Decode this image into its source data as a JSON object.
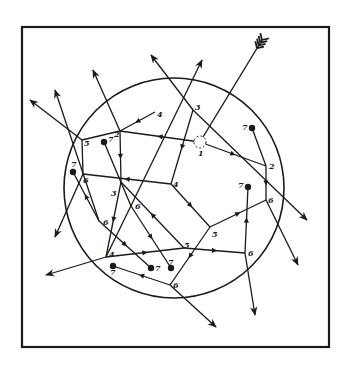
{
  "diagram": {
    "type": "hand-drawn network diagram",
    "colors": {
      "ink": "#1a1a1a",
      "background": "#ffffff"
    },
    "frame": {
      "x": 22,
      "y": 27,
      "width": 307,
      "height": 320
    },
    "circle": {
      "cx": 174,
      "cy": 188,
      "r": 110
    },
    "entry_arrow": {
      "from": [
        262,
        40
      ],
      "to": [
        200,
        142
      ],
      "fletching": true
    },
    "start_marker": {
      "x": 200,
      "y": 142,
      "r": 6,
      "style": "dashed"
    },
    "nodes": [
      {
        "id": "n1",
        "label": "1",
        "x": 200,
        "y": 142,
        "lx": 198,
        "ly": 156
      },
      {
        "id": "n2a",
        "label": "2",
        "x": 120,
        "y": 131,
        "lx": 114,
        "ly": 137
      },
      {
        "id": "n2b",
        "label": "2",
        "x": 266,
        "y": 166,
        "lx": 269,
        "ly": 169
      },
      {
        "id": "n3a",
        "label": "3",
        "x": 193,
        "y": 110,
        "lx": 195,
        "ly": 110
      },
      {
        "id": "n3b",
        "label": "3",
        "x": 121,
        "y": 182,
        "lx": 111,
        "ly": 196
      },
      {
        "id": "n4a",
        "label": "4",
        "x": 155,
        "y": 112,
        "lx": 157,
        "ly": 117
      },
      {
        "id": "n4b",
        "label": "4",
        "x": 171,
        "y": 184,
        "lx": 173,
        "ly": 187
      },
      {
        "id": "n4c",
        "label": "4",
        "x": 106,
        "y": 257,
        "lx": 109,
        "ly": 257
      },
      {
        "id": "n5a",
        "label": "5",
        "x": 82,
        "y": 140,
        "lx": 84,
        "ly": 146
      },
      {
        "id": "n5b",
        "label": "5",
        "x": 210,
        "y": 227,
        "lx": 212,
        "ly": 237
      },
      {
        "id": "n5c",
        "label": "5",
        "x": 184,
        "y": 248,
        "lx": 184,
        "ly": 248
      },
      {
        "id": "n6a",
        "label": "6",
        "x": 83,
        "y": 174,
        "lx": 83,
        "ly": 183
      },
      {
        "id": "n6b",
        "label": "6",
        "x": 99,
        "y": 221,
        "lx": 103,
        "ly": 225
      },
      {
        "id": "n6c",
        "label": "6",
        "x": 131,
        "y": 206,
        "lx": 135,
        "ly": 209
      },
      {
        "id": "n6d",
        "label": "6",
        "x": 266,
        "y": 200,
        "lx": 268,
        "ly": 203
      },
      {
        "id": "n6e",
        "label": "6",
        "x": 245,
        "y": 253,
        "lx": 248,
        "ly": 256
      },
      {
        "id": "n6f",
        "label": "6",
        "x": 170,
        "y": 285,
        "lx": 173,
        "ly": 288
      }
    ],
    "terminals": [
      {
        "id": "t1",
        "label": "7",
        "x": 252,
        "y": 128,
        "lx": 242,
        "ly": 130
      },
      {
        "id": "t2",
        "label": "7",
        "x": 248,
        "y": 187,
        "lx": 238,
        "ly": 188
      },
      {
        "id": "t3",
        "label": "7",
        "x": 73,
        "y": 172,
        "lx": 71,
        "ly": 167
      },
      {
        "id": "t4",
        "label": "7",
        "x": 104,
        "y": 142,
        "lx": 108,
        "ly": 142
      },
      {
        "id": "t5",
        "label": "7",
        "x": 113,
        "y": 266,
        "lx": 110,
        "ly": 275
      },
      {
        "id": "t6",
        "label": "7",
        "x": 151,
        "y": 268,
        "lx": 155,
        "ly": 271
      },
      {
        "id": "t7",
        "label": "7",
        "x": 171,
        "y": 268,
        "lx": 168,
        "ly": 265
      }
    ],
    "edges": [
      {
        "from": [
          200,
          142
        ],
        "to": [
          120,
          131
        ],
        "arrow_mid": true
      },
      {
        "from": [
          200,
          142
        ],
        "to": [
          266,
          166
        ],
        "arrow_mid": true
      },
      {
        "from": [
          120,
          131
        ],
        "to": [
          82,
          140
        ],
        "arrow_mid": false
      },
      {
        "from": [
          120,
          131
        ],
        "to": [
          121,
          182
        ],
        "arrow_mid": true
      },
      {
        "from": [
          193,
          110
        ],
        "to": [
          171,
          184
        ],
        "arrow_mid": true
      },
      {
        "from": [
          171,
          184
        ],
        "to": [
          83,
          174
        ],
        "arrow_mid": true
      },
      {
        "from": [
          171,
          184
        ],
        "to": [
          210,
          227
        ],
        "arrow_mid": true
      },
      {
        "from": [
          155,
          112
        ],
        "to": [
          120,
          131
        ],
        "arrow_mid": true
      },
      {
        "from": [
          210,
          227
        ],
        "to": [
          266,
          200
        ],
        "arrow_mid": true
      },
      {
        "from": [
          210,
          227
        ],
        "to": [
          170,
          285
        ],
        "arrow_mid": true
      },
      {
        "from": [
          266,
          166
        ],
        "to": [
          266,
          200
        ],
        "arrow_mid": true
      },
      {
        "from": [
          266,
          166
        ],
        "to": [
          252,
          128
        ],
        "arrow_mid": false
      },
      {
        "from": [
          266,
          200
        ],
        "to": [
          298,
          265
        ],
        "arrow_end": true
      },
      {
        "from": [
          245,
          253
        ],
        "to": [
          248,
          187
        ],
        "arrow_mid": true
      },
      {
        "from": [
          245,
          253
        ],
        "to": [
          255,
          315
        ],
        "arrow_end": true
      },
      {
        "from": [
          184,
          248
        ],
        "to": [
          245,
          253
        ],
        "arrow_mid": true
      },
      {
        "from": [
          106,
          257
        ],
        "to": [
          184,
          248
        ],
        "arrow_mid": true
      },
      {
        "from": [
          106,
          257
        ],
        "to": [
          46,
          275
        ],
        "arrow_end": true
      },
      {
        "from": [
          121,
          182
        ],
        "to": [
          106,
          257
        ],
        "arrow_mid": true
      },
      {
        "from": [
          170,
          285
        ],
        "to": [
          113,
          266
        ],
        "arrow_mid": true
      },
      {
        "from": [
          170,
          285
        ],
        "to": [
          216,
          327
        ],
        "arrow_end": true
      },
      {
        "from": [
          99,
          221
        ],
        "to": [
          151,
          268
        ],
        "arrow_mid": true
      },
      {
        "from": [
          131,
          206
        ],
        "to": [
          171,
          268
        ],
        "arrow_mid": true
      },
      {
        "from": [
          131,
          206
        ],
        "to": [
          104,
          142
        ],
        "arrow_mid": false
      },
      {
        "from": [
          184,
          248
        ],
        "to": [
          121,
          182
        ],
        "arrow_mid": true
      },
      {
        "from": [
          83,
          174
        ],
        "to": [
          82,
          140
        ],
        "arrow_mid": false
      },
      {
        "from": [
          83,
          174
        ],
        "to": [
          55,
          237
        ],
        "arrow_end": true
      },
      {
        "from": [
          99,
          221
        ],
        "to": [
          73,
          172
        ],
        "arrow_mid": true
      },
      {
        "from": [
          82,
          140
        ],
        "to": [
          30,
          100
        ],
        "arrow_end": true
      },
      {
        "from": [
          99,
          221
        ],
        "to": [
          55,
          90
        ],
        "arrow_end": true
      },
      {
        "from": [
          120,
          131
        ],
        "to": [
          93,
          70
        ],
        "arrow_end": true
      },
      {
        "from": [
          193,
          110
        ],
        "to": [
          151,
          55
        ],
        "arrow_end": true
      },
      {
        "from": [
          106,
          257
        ],
        "to": [
          202,
          60
        ],
        "arrow_end": true
      },
      {
        "from": [
          193,
          110
        ],
        "to": [
          307,
          220
        ],
        "arrow_end": true
      }
    ]
  }
}
